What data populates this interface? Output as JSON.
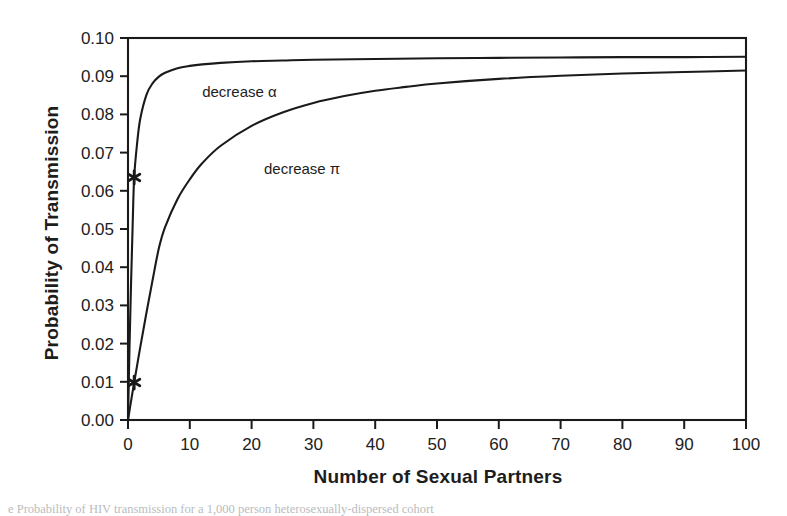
{
  "figure": {
    "ylabel": "Probability of Transmission",
    "xlabel": "Number of Sexual Partners",
    "caption": "e Probability of HIV transmission for a 1,000 person heterosexually-dispersed cohort"
  },
  "chart_data": {
    "type": "line",
    "title": "",
    "xlabel": "Number of Sexual Partners",
    "ylabel": "Probability of Transmission",
    "xlim": [
      0,
      100
    ],
    "ylim": [
      0.0,
      0.1
    ],
    "xticks": [
      "0",
      "10",
      "20",
      "30",
      "40",
      "50",
      "60",
      "70",
      "80",
      "90",
      "100"
    ],
    "xtick_values": [
      0,
      10,
      20,
      30,
      40,
      50,
      60,
      70,
      80,
      90,
      100
    ],
    "yticks": [
      "0.00",
      "0.01",
      "0.02",
      "0.03",
      "0.04",
      "0.05",
      "0.06",
      "0.07",
      "0.08",
      "0.09",
      "0.10"
    ],
    "ytick_values": [
      0.0,
      0.01,
      0.02,
      0.03,
      0.04,
      0.05,
      0.06,
      0.07,
      0.08,
      0.09,
      0.1
    ],
    "grid": false,
    "legend": "inline-annotations",
    "line_color": "#1a1a1a",
    "series": [
      {
        "name": "decrease α",
        "label": "decrease α",
        "label_x": 12,
        "label_y": 0.0845,
        "x": [
          0,
          0.25,
          0.5,
          0.75,
          1,
          1.5,
          2,
          3,
          4,
          5,
          6,
          8,
          10,
          12,
          15,
          20,
          25,
          30,
          40,
          50,
          60,
          70,
          80,
          90,
          100
        ],
        "y": [
          0.0,
          0.0195,
          0.0362,
          0.0508,
          0.0635,
          0.0728,
          0.079,
          0.0852,
          0.0882,
          0.0899,
          0.0909,
          0.0921,
          0.0927,
          0.0931,
          0.0935,
          0.0939,
          0.0941,
          0.0943,
          0.0945,
          0.0947,
          0.0948,
          0.0949,
          0.095,
          0.095,
          0.0951
        ],
        "markers": [
          {
            "x": 1,
            "y": 0.0635,
            "style": "star"
          }
        ]
      },
      {
        "name": "decrease π",
        "label": "decrease π",
        "label_x": 22,
        "label_y": 0.0645,
        "x": [
          0,
          0.5,
          1,
          2,
          3,
          4,
          5,
          6,
          8,
          10,
          12,
          15,
          20,
          25,
          30,
          35,
          40,
          45,
          50,
          60,
          70,
          80,
          90,
          100
        ],
        "y": [
          0.0,
          0.005,
          0.0098,
          0.0192,
          0.0282,
          0.0368,
          0.045,
          0.0505,
          0.0578,
          0.063,
          0.0672,
          0.0718,
          0.077,
          0.0805,
          0.083,
          0.0848,
          0.0862,
          0.0872,
          0.0881,
          0.0893,
          0.0901,
          0.0907,
          0.0911,
          0.0915
        ],
        "markers": [
          {
            "x": 1,
            "y": 0.0098,
            "style": "star"
          }
        ]
      }
    ]
  }
}
